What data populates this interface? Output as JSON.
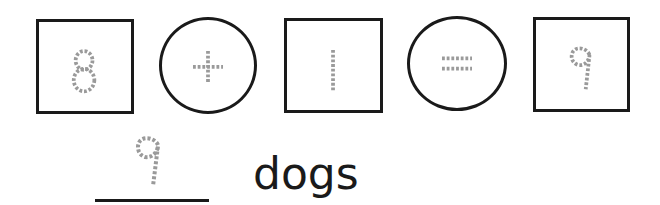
{
  "equation": {
    "terms": [
      {
        "kind": "box",
        "value": "8",
        "style": "traced-dotted"
      },
      {
        "kind": "circle",
        "value": "+",
        "style": "traced-dotted"
      },
      {
        "kind": "box",
        "value": "1",
        "style": "traced-dotted"
      },
      {
        "kind": "circle",
        "value": "=",
        "style": "traced-dotted"
      },
      {
        "kind": "box",
        "value": "9",
        "style": "traced-dotted"
      }
    ]
  },
  "answer": {
    "value": "9",
    "unit": "dogs"
  },
  "colors": {
    "outline": "#1a1a1a",
    "traced": "#9a9a9a",
    "background": "#ffffff"
  }
}
